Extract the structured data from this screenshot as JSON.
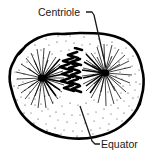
{
  "figure": {
    "background_color": "#ffffff",
    "ink_color": "#000000",
    "labels": {
      "centriole": "Centriole",
      "equator": "Equator"
    },
    "structures": {
      "cell_membrane": "cell-membrane-outline",
      "left_aster": "left-aster-centriole",
      "right_aster": "right-aster-centriole",
      "chromosomes": "chromosomes-at-equator",
      "cytoplasm_stipple": "cytoplasm-stipple"
    },
    "leader_lines": {
      "centriole_leader": "centriole-leader-line",
      "equator_leader": "equator-leader-line"
    }
  }
}
